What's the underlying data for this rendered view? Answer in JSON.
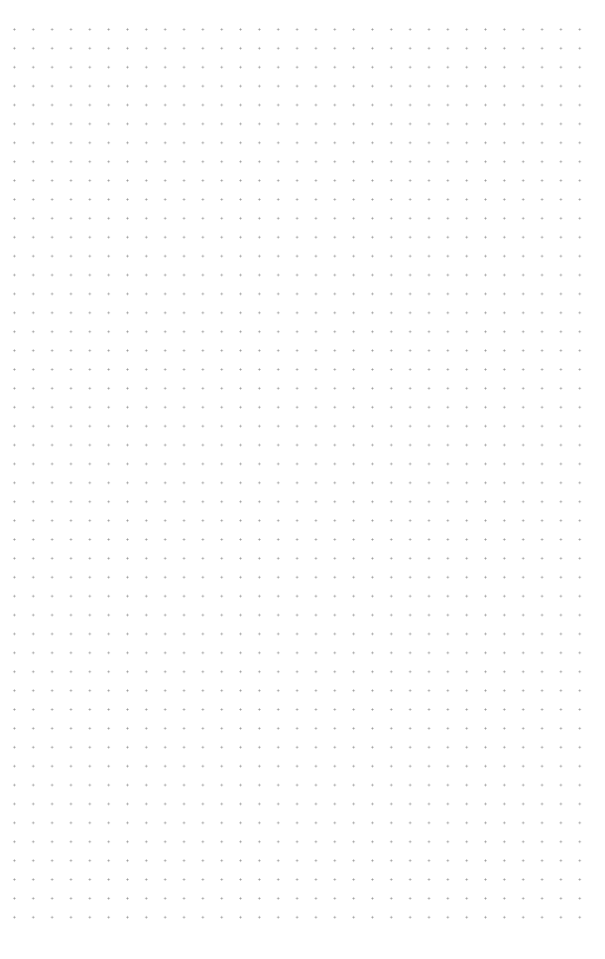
{
  "canvas": {
    "type": "dot-grid",
    "background_color": "#ffffff",
    "dot_color": "#9a9a9a",
    "dot_spacing_px": 18.9,
    "columns": 30,
    "rows": 48
  }
}
